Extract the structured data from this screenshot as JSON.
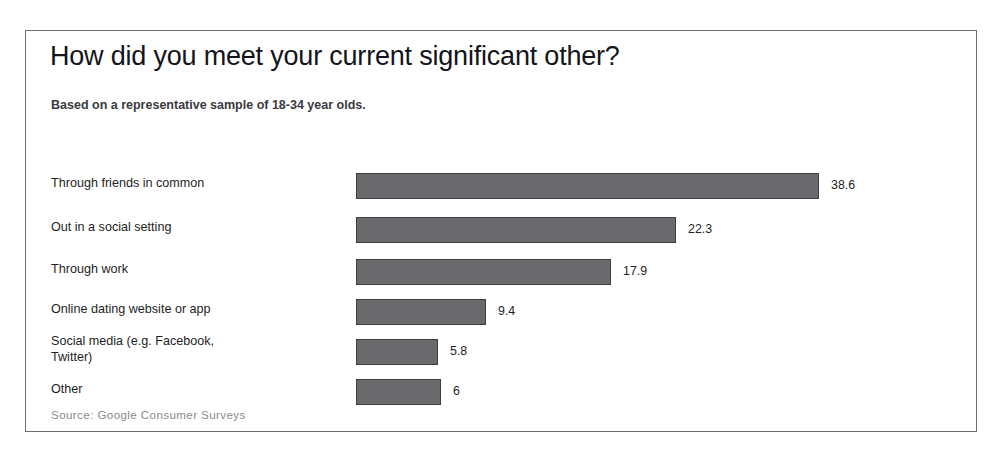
{
  "chart_data": {
    "type": "bar",
    "orientation": "horizontal",
    "title": "How did you meet your current significant other?",
    "subtitle": "Based on a representative sample of 18-34 year olds.",
    "source": "Source: Google Consumer Surveys",
    "xlabel": "",
    "ylabel": "",
    "xlim": [
      0,
      38.6
    ],
    "grid": false,
    "legend": "none",
    "bar_color": "#6a6a6c",
    "bar_border_color": "#3d3d42",
    "categories": [
      "Through friends in common",
      "Out in a social setting",
      "Through work",
      "Online dating website or app",
      "Social media (e.g. Facebook,\nTwitter)",
      "Other"
    ],
    "values": [
      38.6,
      22.3,
      17.9,
      9.4,
      5.8,
      6
    ],
    "value_labels": [
      "38.6",
      "22.3",
      "17.9",
      "9.4",
      "5.8",
      "6"
    ],
    "bar_pixel_widths": [
      463,
      320,
      255,
      130,
      82,
      85
    ],
    "rows": [
      {
        "label": "Through friends in common",
        "value": 38.6,
        "label_text": "38.6",
        "top": 30,
        "height": 26,
        "bar_px": 463,
        "label_top": 32,
        "value_top": 36
      },
      {
        "label": "Out in a social setting",
        "value": 22.3,
        "label_text": "22.3",
        "top": 74,
        "height": 26,
        "bar_px": 320,
        "label_top": 76,
        "value_top": 80
      },
      {
        "label": "Through work",
        "value": 17.9,
        "label_text": "17.9",
        "top": 116,
        "height": 26,
        "bar_px": 255,
        "label_top": 118,
        "value_top": 122
      },
      {
        "label": "Online dating website or app",
        "value": 9.4,
        "label_text": "9.4",
        "top": 156,
        "height": 26,
        "bar_px": 130,
        "label_top": 158,
        "value_top": 162
      },
      {
        "label": "Social media (e.g. Facebook,\nTwitter)",
        "value": 5.8,
        "label_text": "5.8",
        "top": 196,
        "height": 26,
        "bar_px": 82,
        "label_top": 190,
        "value_top": 202
      },
      {
        "label": "Other",
        "value": 6,
        "label_text": "6",
        "top": 236,
        "height": 26,
        "bar_px": 85,
        "label_top": 238,
        "value_top": 242
      }
    ]
  }
}
